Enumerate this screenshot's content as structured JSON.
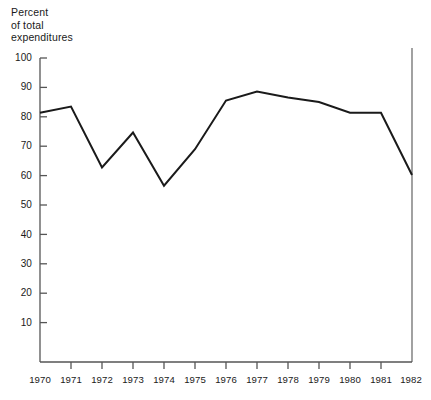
{
  "chart_data": {
    "type": "line",
    "title": "",
    "xlabel": "",
    "ylabel": "Percent\nof total\nexpenditures",
    "ylabel_lines": [
      "Percent",
      "of total",
      "expenditures"
    ],
    "x": [
      1970,
      1971,
      1972,
      1973,
      1974,
      1975,
      1976,
      1977,
      1978,
      1979,
      1980,
      1981,
      1982
    ],
    "categories": [
      "1970",
      "1971",
      "1972",
      "1973",
      "1974",
      "1975",
      "1976",
      "1977",
      "1978",
      "1979",
      "1980",
      "1981",
      "1982"
    ],
    "values": [
      82,
      84,
      64,
      75.5,
      58,
      70,
      86,
      89,
      87,
      85.5,
      82,
      82,
      61.5
    ],
    "series": [
      {
        "name": "Percent of total expenditures",
        "values": [
          82,
          84,
          64,
          75.5,
          58,
          70,
          86,
          89,
          87,
          85.5,
          82,
          82,
          61.5
        ]
      }
    ],
    "xlim": [
      1970,
      1982
    ],
    "ylim": [
      0,
      100
    ],
    "ytick_labels": [
      "100",
      "90",
      "80",
      "70",
      "60",
      "50",
      "40",
      "30",
      "20",
      "10"
    ],
    "ytick_values": [
      100,
      90,
      80,
      70,
      60,
      50,
      40,
      30,
      20,
      10
    ],
    "xtick_labels": [
      "1970",
      "1971",
      "1972",
      "1973",
      "1974",
      "1975",
      "1976",
      "1977",
      "1978",
      "1979",
      "1980",
      "1981",
      "1982"
    ],
    "grid": false,
    "legend": false,
    "legend_position": "none",
    "line_color": "#1a1a1a",
    "axis_color": "#555555",
    "background_color": "#ffffff",
    "annotations": [
      {
        "name": "right-boundary-rule",
        "type": "vertical-line",
        "x": 1982,
        "description": "thin vertical rule at 1982 spanning plot height"
      }
    ]
  }
}
